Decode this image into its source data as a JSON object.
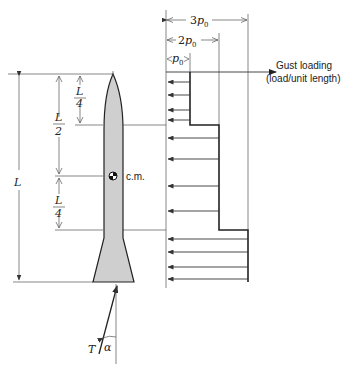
{
  "diagram": {
    "dimensions": {
      "total_length": "L",
      "upper_quarter": {
        "num": "L",
        "den": "4"
      },
      "half": {
        "num": "L",
        "den": "2"
      },
      "lower_quarter": {
        "num": "L",
        "den": "4"
      }
    },
    "center_of_mass_label": "c.m.",
    "load_levels": {
      "p0": {
        "coef": "",
        "sym": "p",
        "sub": "0"
      },
      "two_p0": {
        "coef": "2",
        "sym": "p",
        "sub": "0"
      },
      "three_p0": {
        "coef": "3",
        "sym": "p",
        "sub": "0"
      }
    },
    "gust_label_line1": "Gust loading",
    "gust_label_line2": "(load/unit length)",
    "thrust_label": "T",
    "angle_label": "α",
    "load_distribution": [
      {
        "segment": "top quarter",
        "magnitude_in_p0": 1
      },
      {
        "segment": "middle half",
        "magnitude_in_p0": 2
      },
      {
        "segment": "bottom quarter",
        "magnitude_in_p0": 3
      }
    ]
  }
}
